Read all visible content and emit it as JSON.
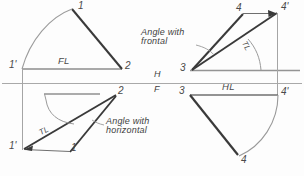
{
  "figure": {
    "colors": {
      "heavy_line": "#3c3c3c",
      "light_line": "#9a9a9a",
      "reference_line": "#a8a8a8",
      "text": "#3f3f3f",
      "background": "#fdfdfd"
    },
    "fold_line": {
      "upper_label": "H",
      "lower_label": "F"
    },
    "labels": {
      "front_line_abbrev": "FL",
      "horizontal_line_abbrev": "HL",
      "true_length_abbrev": "TL",
      "angle_with_frontal": "Angle with\nfrontal",
      "angle_with_horizontal": "Angle with\nhorizontal"
    },
    "quadrants": [
      {
        "name": "top-left",
        "description": "Front view revolved: line 1'-2 with FL and rotated true length to point 1",
        "points": [
          "1",
          "1'",
          "2"
        ],
        "line_label": "FL"
      },
      {
        "name": "bottom-left",
        "description": "Top view revolved about 1' giving TL and angle with horizontal",
        "points": [
          "1'",
          "1",
          "2"
        ],
        "line_label": "TL",
        "angle_label": "Angle with\nhorizontal"
      },
      {
        "name": "top-right",
        "description": "Top view revolved about 3 giving TL and angle with frontal",
        "points": [
          "3",
          "4",
          "4'"
        ],
        "line_label": "TL",
        "angle_label": "Angle with\nfrontal"
      },
      {
        "name": "bottom-right",
        "description": "Front view: line 3-4' with HL and revolved point 4",
        "points": [
          "3",
          "4'",
          "4"
        ],
        "line_label": "HL"
      }
    ],
    "point_labels": {
      "tl_apex": "1",
      "tl_origin": "1'",
      "tl_right": "2",
      "bl_origin": "1'",
      "bl_foot": "1",
      "bl_right": "2",
      "tr_origin": "3",
      "tr_rev": "4",
      "tr_right": "4'",
      "br_origin": "3",
      "br_right": "4'",
      "br_rev": "4"
    }
  }
}
